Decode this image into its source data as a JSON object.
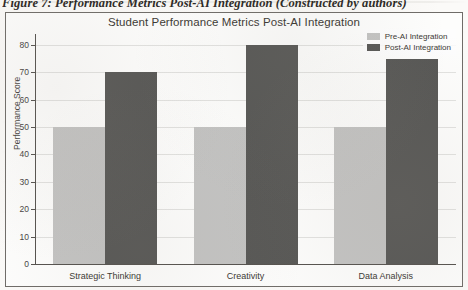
{
  "caption": {
    "text": "Figure 7: Performance Metrics Post-AI Integration (Constructed by authors)"
  },
  "colors": {
    "pre_ai": "#c3c3c2",
    "post_ai": "#575755",
    "frame": "#6f6c68",
    "text": "#3a3732",
    "paper": "#fbfaf8"
  },
  "legend": {
    "position": "top-right",
    "entries": [
      {
        "label": "Pre-AI Integration",
        "color": "#c3c3c2"
      },
      {
        "label": "Post-AI Integration",
        "color": "#575755"
      }
    ]
  },
  "chart_data": {
    "type": "bar",
    "title": "Student Performance Metrics Post-AI Integration",
    "xlabel": "",
    "ylabel": "Performance Score",
    "ylim": [
      0,
      84
    ],
    "yticks": [
      0,
      10,
      20,
      30,
      40,
      50,
      60,
      70,
      80
    ],
    "ytick_labels": [
      "0",
      "10",
      "20",
      "30",
      "40",
      "50",
      "60",
      "70",
      "80"
    ],
    "grid": true,
    "legend_position": "upper right",
    "categories": [
      "Strategic Thinking",
      "Creativity",
      "Data Analysis"
    ],
    "series": [
      {
        "name": "Pre-AI Integration",
        "color": "#c3c3c2",
        "values": [
          50,
          50,
          50
        ]
      },
      {
        "name": "Post-AI Integration",
        "color": "#575755",
        "values": [
          70,
          80,
          75
        ]
      }
    ]
  }
}
